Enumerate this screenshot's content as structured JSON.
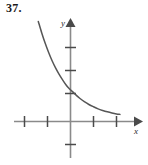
{
  "figure": {
    "exercise_number": "37.",
    "background_color": "#ffffff",
    "axis_color": "#8a8a8a",
    "tick_color": "#4a4a4a",
    "curve_color": "#565656",
    "label_color": "#2b2b2b"
  },
  "axes": {
    "x_label": "x",
    "y_label": "y",
    "x_arrow": "arrow-right",
    "y_arrow": "arrow-up"
  },
  "chart_data": {
    "type": "line",
    "title": "",
    "subtitle": "",
    "xlabel": "x",
    "ylabel": "y",
    "xlim": [
      -2.5,
      2.3
    ],
    "ylim": [
      -1.6,
      3.4
    ],
    "grid": false,
    "legend": null,
    "x_ticks": [
      -2,
      -1,
      1,
      2
    ],
    "y_ticks": [
      -1,
      1,
      2,
      3
    ],
    "x_tick_labels": [
      "",
      "",
      "",
      ""
    ],
    "y_tick_labels": [
      "",
      "",
      "",
      ""
    ],
    "series": [
      {
        "name": "exponential-decay",
        "x": [
          -1.4,
          -1.25,
          -1.1,
          -0.95,
          -0.8,
          -0.65,
          -0.5,
          -0.35,
          -0.2,
          -0.05,
          0.0,
          0.2,
          0.4,
          0.6,
          0.8,
          1.0,
          1.2,
          1.4,
          1.6,
          1.8,
          2.0,
          2.15
        ],
        "y": [
          4.35,
          3.85,
          3.4,
          3.0,
          2.64,
          2.33,
          2.06,
          1.82,
          1.6,
          1.42,
          1.38,
          1.19,
          1.01,
          0.86,
          0.74,
          0.64,
          0.55,
          0.48,
          0.42,
          0.37,
          0.33,
          0.31
        ]
      }
    ]
  }
}
